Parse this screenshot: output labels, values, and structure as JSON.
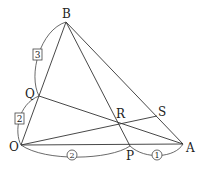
{
  "diagram": {
    "points": {
      "O": {
        "label": "O",
        "x": 21,
        "y": 145
      },
      "A": {
        "label": "A",
        "x": 183,
        "y": 144
      },
      "B": {
        "label": "B",
        "x": 66,
        "y": 22
      },
      "P": {
        "label": "P",
        "x": 130,
        "y": 146
      },
      "Q": {
        "label": "Q",
        "x": 39,
        "y": 96
      },
      "R": {
        "label": "R",
        "x": 117,
        "y": 122
      },
      "S": {
        "label": "S",
        "x": 157,
        "y": 116
      }
    },
    "segments": [
      "OA",
      "OB",
      "AB",
      "BP",
      "QA",
      "OS"
    ],
    "ratio_marks": {
      "BQ": {
        "text": "3",
        "style": "boxed"
      },
      "QO": {
        "text": "2",
        "style": "boxed"
      },
      "OP": {
        "text": "2",
        "style": "circled"
      },
      "PA": {
        "text": "1",
        "style": "circled"
      }
    }
  }
}
